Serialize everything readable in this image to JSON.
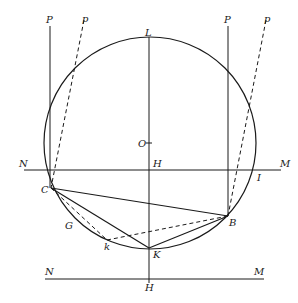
{
  "diagram": {
    "type": "geometric-construction",
    "labels": {
      "P_left": "P",
      "p_left": "p",
      "P_right": "P",
      "p_right": "p",
      "L": "L",
      "O": "O",
      "H_upper": "H",
      "N_upper": "N",
      "M_upper": "M",
      "I": "I",
      "C": "C",
      "G": "G",
      "B": "B",
      "k": "k",
      "K": "K",
      "N_lower": "N",
      "M_lower": "M",
      "H_lower": "H"
    },
    "colors": {
      "ink": "#1a1a1a",
      "background": "#ffffff"
    }
  }
}
